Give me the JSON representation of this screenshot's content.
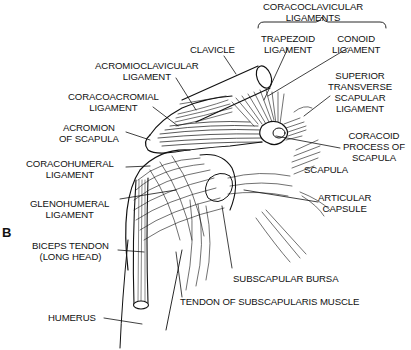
{
  "figure": {
    "panel_letter": "B"
  },
  "labels": {
    "coracoclavicular_ligaments": {
      "line1": "CORACOCLAVICULAR",
      "line2": "LIGAMENTS"
    },
    "trapezoid_ligament": {
      "line1": "TRAPEZOID",
      "line2": "LIGAMENT"
    },
    "conoid_ligament": {
      "line1": "CONOID",
      "line2": "LIGAMENT"
    },
    "clavicle": {
      "line1": "CLAVICLE"
    },
    "acromioclavicular_ligament": {
      "line1": "ACROMIOCLAVICULAR",
      "line2": "LIGAMENT"
    },
    "coracoacromial_ligament": {
      "line1": "CORACOACROMIAL",
      "line2": "LIGAMENT"
    },
    "acromion_of_scapula": {
      "line1": "ACROMION",
      "line2": "OF SCAPULA"
    },
    "superior_transverse_scapular_ligament": {
      "line1": "SUPERIOR",
      "line2": "TRANSVERSE",
      "line3": "SCAPULAR",
      "line4": "LIGAMENT"
    },
    "coracoid_process": {
      "line1": "CORACOID",
      "line2": "PROCESS OF",
      "line3": "SCAPULA"
    },
    "scapula": {
      "line1": "SCAPULA"
    },
    "coracohumeral_ligament": {
      "line1": "CORACOHUMERAL",
      "line2": "LIGAMENT"
    },
    "glenohumeral_ligament": {
      "line1": "GLENOHUMERAL",
      "line2": "LIGAMENT"
    },
    "articular_capsule": {
      "line1": "ARTICULAR",
      "line2": "CAPSULE"
    },
    "biceps_tendon": {
      "line1": "BICEPS TENDON",
      "line2": "(LONG HEAD)"
    },
    "subscapular_bursa": {
      "line1": "SUBSCAPULAR BURSA"
    },
    "humerus": {
      "line1": "HUMERUS"
    },
    "tendon_of_subscapularis": {
      "line1": "TENDON OF SUBSCAPULARIS MUSCLE"
    }
  },
  "colors": {
    "ink": "#111111",
    "background": "#ffffff"
  }
}
